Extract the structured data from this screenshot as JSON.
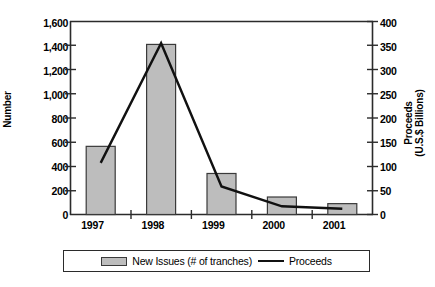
{
  "chart_data": {
    "type": "bar",
    "title": "",
    "xlabel": "",
    "categories": [
      "1997",
      "1998",
      "1999",
      "2000",
      "2001"
    ],
    "grid": false,
    "legend_position": "bottom",
    "series": [
      {
        "name": "New Issues (# of tranches)",
        "type": "bar",
        "axis": "left",
        "values": [
          565,
          1410,
          340,
          145,
          90
        ],
        "color": "#bdbdbd"
      },
      {
        "name": "Proceeds",
        "type": "line",
        "axis": "right",
        "values": [
          107,
          355,
          58,
          17,
          12
        ],
        "color": "#111111"
      }
    ],
    "axes": {
      "left": {
        "label": "Number",
        "ylim": [
          0,
          1600
        ],
        "tick_step": 200,
        "ticks": [
          "0",
          "200",
          "400",
          "600",
          "800",
          "1,000",
          "1,200",
          "1,400",
          "1,600"
        ]
      },
      "right": {
        "label_line1": "Proceeds",
        "label_line2": "(U.S.$ Billions)",
        "ylim": [
          0,
          400
        ],
        "tick_step": 50,
        "ticks": [
          "0",
          "50",
          "100",
          "150",
          "200",
          "250",
          "300",
          "350",
          "400"
        ]
      }
    }
  },
  "legend": {
    "items": [
      {
        "label": "New Issues (# of tranches)",
        "marker": "bar-swatch"
      },
      {
        "label": "Proceeds",
        "marker": "line-swatch"
      }
    ]
  },
  "colors": {
    "bar_fill": "#bdbdbd",
    "bar_stroke": "#3a3a3a",
    "line": "#111111",
    "axis": "#2b2b2b",
    "text": "#000000",
    "background": "#ffffff"
  }
}
